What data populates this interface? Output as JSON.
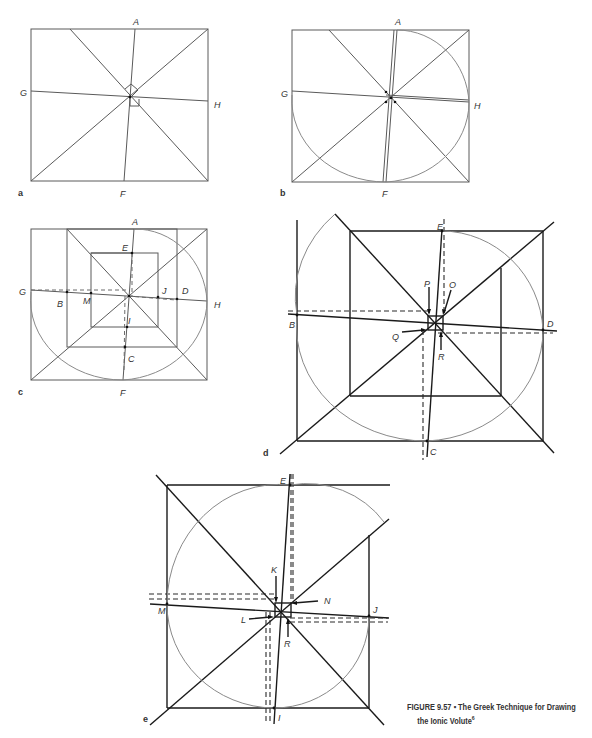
{
  "figure": {
    "number": "FIGURE 9.57",
    "separator": "▪",
    "title_line1": "The Greek Technique for Drawing",
    "title_line2": "the Ionic Volute",
    "footnote": "6"
  },
  "panels": {
    "a": {
      "tag": "a",
      "labels": {
        "A": "A",
        "G": "G",
        "H": "H",
        "F": "F"
      }
    },
    "b": {
      "tag": "b",
      "labels": {
        "A": "A",
        "G": "G",
        "H": "H",
        "F": "F"
      }
    },
    "c": {
      "tag": "c",
      "labels": {
        "A": "A",
        "E": "E",
        "G": "G",
        "B": "B",
        "M": "M",
        "J": "J",
        "D": "D",
        "H": "H",
        "I": "I",
        "C": "C",
        "F": "F"
      }
    },
    "d": {
      "tag": "d",
      "labels": {
        "E": "E",
        "P": "P",
        "O": "O",
        "B": "B",
        "D": "D",
        "Q": "Q",
        "R": "R",
        "C": "C"
      }
    },
    "e": {
      "tag": "e",
      "labels": {
        "E": "E",
        "K": "K",
        "N": "N",
        "M": "M",
        "J": "J",
        "L": "L",
        "R": "R",
        "I": "I"
      }
    }
  }
}
